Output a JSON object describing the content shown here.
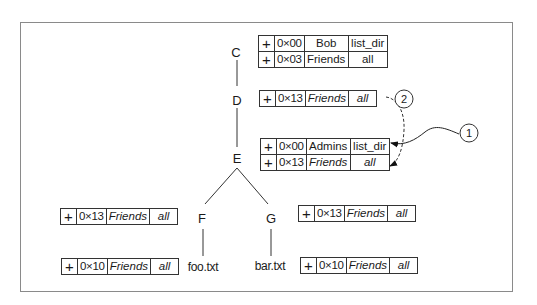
{
  "tree": {
    "nodes": [
      {
        "id": "C",
        "label": "C"
      },
      {
        "id": "D",
        "label": "D"
      },
      {
        "id": "E",
        "label": "E"
      },
      {
        "id": "F",
        "label": "F"
      },
      {
        "id": "G",
        "label": "G"
      }
    ],
    "files": [
      {
        "id": "foo",
        "label": "foo.txt"
      },
      {
        "id": "bar",
        "label": "bar.txt"
      }
    ]
  },
  "acls": {
    "C": [
      {
        "sign": "+",
        "id": "0×00",
        "principal": "Bob",
        "perm": "list_dir",
        "italic": false
      },
      {
        "sign": "+",
        "id": "0×03",
        "principal": "Friends",
        "perm": "all",
        "italic": false
      }
    ],
    "D": [
      {
        "sign": "+",
        "id": "0×13",
        "principal": "Friends",
        "perm": "all",
        "italic": true
      }
    ],
    "E": [
      {
        "sign": "+",
        "id": "0×00",
        "principal": "Admins",
        "perm": "list_dir",
        "italic": false
      },
      {
        "sign": "+",
        "id": "0×13",
        "principal": "Friends",
        "perm": "all",
        "italic": true
      }
    ],
    "F": [
      {
        "sign": "+",
        "id": "0×13",
        "principal": "Friends",
        "perm": "all",
        "italic": true
      }
    ],
    "G": [
      {
        "sign": "+",
        "id": "0×13",
        "principal": "Friends",
        "perm": "all",
        "italic": true
      }
    ],
    "foo": [
      {
        "sign": "+",
        "id": "0×10",
        "principal": "Friends",
        "perm": "all",
        "italic": true
      }
    ],
    "bar": [
      {
        "sign": "+",
        "id": "0×10",
        "principal": "Friends",
        "perm": "all",
        "italic": true
      }
    ]
  },
  "callouts": [
    {
      "id": "1",
      "label": "1"
    },
    {
      "id": "2",
      "label": "2"
    }
  ]
}
